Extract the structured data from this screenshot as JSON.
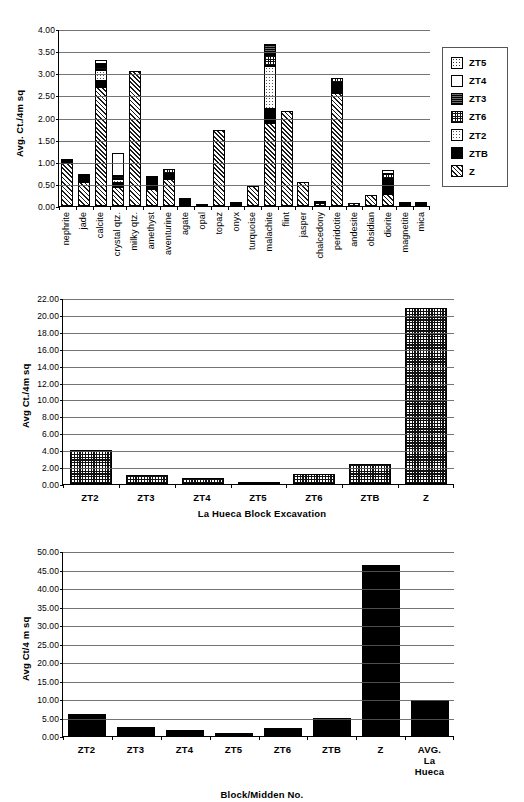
{
  "figure": {
    "charts": [
      {
        "id": "chart-raw-material-by-block",
        "ylabel": "Avg. Ct./4m sq",
        "xlabel": "",
        "yticks": [
          "0.00",
          "0.50",
          "1.00",
          "1.50",
          "2.00",
          "2.50",
          "3.00",
          "3.50",
          "4.00"
        ],
        "legend": [
          {
            "name": "ZT5",
            "pattern": "ZT5"
          },
          {
            "name": "ZT4",
            "pattern": "ZT4"
          },
          {
            "name": "ZT3",
            "pattern": "ZT3"
          },
          {
            "name": "ZT6",
            "pattern": "ZT6"
          },
          {
            "name": "ZT2",
            "pattern": "ZT2"
          },
          {
            "name": "ZTB",
            "pattern": "ZTB"
          },
          {
            "name": "Z",
            "pattern": "Z"
          }
        ]
      },
      {
        "id": "chart-la-hueca-block-excavation",
        "ylabel": "Avg Ct./4m sq",
        "xlabel": "La Hueca Block Excavation",
        "yticks": [
          "0.00",
          "2.00",
          "4.00",
          "6.00",
          "8.00",
          "10.00",
          "12.00",
          "14.00",
          "16.00",
          "18.00",
          "20.00",
          "22.00"
        ]
      },
      {
        "id": "chart-block-midden",
        "ylabel": "Avg Ct/4 m sq",
        "xlabel": "Block/Midden No.",
        "yticks": [
          "0.00",
          "5.00",
          "10.00",
          "15.00",
          "20.00",
          "25.00",
          "30.00",
          "35.00",
          "40.00",
          "45.00",
          "50.00"
        ]
      }
    ]
  },
  "chart_data": [
    {
      "type": "bar",
      "stacked": true,
      "title": "",
      "xlabel": "",
      "ylabel": "Avg. Ct./4m sq",
      "ylim": [
        0,
        4.0
      ],
      "ytick_step": 0.5,
      "grid": true,
      "legend_position": "right",
      "categories": [
        "nephrite",
        "jade",
        "calcite",
        "crystal qtz.",
        "milky qtz.",
        "amethyst",
        "aventurine",
        "agate",
        "opal",
        "topaz",
        "onyx",
        "turquoise",
        "malachite",
        "flint",
        "jasper",
        "chalcedony",
        "peridotite",
        "andesite",
        "obsidian",
        "diorite",
        "magnetite",
        "mica"
      ],
      "series": [
        {
          "name": "Z",
          "pattern": "Z",
          "values": [
            0.97,
            0.55,
            2.68,
            0.42,
            3.04,
            0.38,
            0.62,
            0.0,
            0.02,
            1.72,
            0.05,
            0.45,
            1.88,
            2.14,
            0.55,
            0.07,
            2.55,
            0.06,
            0.24,
            0.27,
            0.02,
            0.04
          ]
        },
        {
          "name": "ZTB",
          "pattern": "ZTB",
          "values": [
            0.1,
            0.12,
            0.14,
            0.11,
            0.0,
            0.16,
            0.11,
            0.17,
            0.0,
            0.0,
            0.02,
            0.0,
            0.31,
            0.0,
            0.0,
            0.0,
            0.23,
            0.0,
            0.0,
            0.35,
            0.03,
            0.0
          ]
        },
        {
          "name": "ZT2",
          "pattern": "ZT2",
          "values": [
            0.0,
            0.0,
            0.25,
            0.08,
            0.0,
            0.03,
            0.0,
            0.0,
            0.0,
            0.0,
            0.0,
            0.0,
            0.97,
            0.0,
            0.0,
            0.03,
            0.0,
            0.0,
            0.0,
            0.0,
            0.0,
            0.02
          ]
        },
        {
          "name": "ZT6",
          "pattern": "ZT6",
          "values": [
            0.0,
            0.03,
            0.07,
            0.07,
            0.0,
            0.04,
            0.1,
            0.0,
            0.0,
            0.0,
            0.0,
            0.0,
            0.26,
            0.0,
            0.0,
            0.0,
            0.12,
            0.0,
            0.0,
            0.1,
            0.0,
            0.0
          ]
        },
        {
          "name": "ZT3",
          "pattern": "ZT3",
          "values": [
            0.0,
            0.0,
            0.06,
            0.0,
            0.0,
            0.0,
            0.0,
            0.0,
            0.0,
            0.0,
            0.0,
            0.0,
            0.25,
            0.0,
            0.0,
            0.0,
            0.0,
            0.0,
            0.0,
            0.0,
            0.0,
            0.0
          ]
        },
        {
          "name": "ZT4",
          "pattern": "ZT4",
          "values": [
            0.0,
            0.0,
            0.09,
            0.51,
            0.0,
            0.05,
            0.0,
            0.0,
            0.0,
            0.0,
            0.0,
            0.0,
            0.0,
            0.0,
            0.0,
            0.0,
            0.0,
            0.0,
            0.0,
            0.1,
            0.0,
            0.0
          ]
        },
        {
          "name": "ZT5",
          "pattern": "ZT5",
          "values": [
            0.0,
            0.0,
            0.0,
            0.0,
            0.0,
            0.0,
            0.0,
            0.0,
            0.0,
            0.0,
            0.0,
            0.0,
            0.0,
            0.0,
            0.0,
            0.0,
            0.0,
            0.0,
            0.0,
            0.0,
            0.0,
            0.0
          ]
        }
      ]
    },
    {
      "type": "bar",
      "stacked": false,
      "title": "",
      "xlabel": "La Hueca Block Excavation",
      "ylabel": "Avg Ct./4m sq",
      "ylim": [
        0,
        22.0
      ],
      "ytick_step": 2.0,
      "grid": true,
      "fill": "check",
      "categories": [
        "ZT2",
        "ZT3",
        "ZT4",
        "ZT5",
        "ZT6",
        "ZTB",
        "Z"
      ],
      "values": [
        4.05,
        1.05,
        0.75,
        0.12,
        1.2,
        2.4,
        20.85
      ]
    },
    {
      "type": "bar",
      "stacked": false,
      "title": "",
      "xlabel": "Block/Midden No.",
      "ylabel": "Avg Ct/4 m sq",
      "ylim": [
        0,
        50.0
      ],
      "ytick_step": 5.0,
      "grid": true,
      "fill": "solid",
      "categories": [
        "ZT2",
        "ZT3",
        "ZT4",
        "ZT5",
        "ZT6",
        "ZTB",
        "Z",
        "AVG. La Hueca"
      ],
      "values": [
        5.9,
        2.5,
        1.7,
        0.8,
        2.3,
        5.0,
        46.3,
        9.6
      ]
    }
  ]
}
